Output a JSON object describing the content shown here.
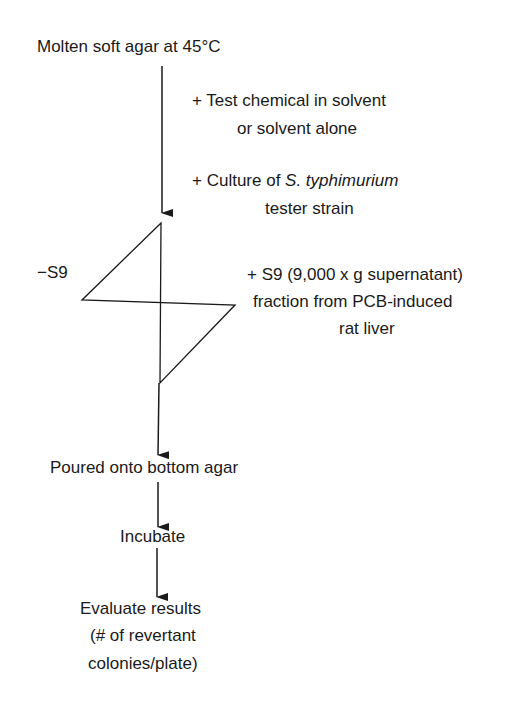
{
  "diagram": {
    "start": "Molten soft agar at 45°C",
    "addition_1": {
      "line1": "+ Test chemical in solvent",
      "line2": "or solvent alone"
    },
    "addition_2": {
      "prefix": "+ Culture of ",
      "organism": "S. typhimurium",
      "line2": "tester strain"
    },
    "branch_left": "−S9",
    "branch_right": {
      "line1": "+ S9 (9,000 x g supernatant)",
      "line2": "fraction from PCB-induced",
      "line3": "rat liver"
    },
    "step_pour": "Poured onto bottom agar",
    "step_incubate": "Incubate",
    "step_evaluate": {
      "line1": "Evaluate  results",
      "line2": "(# of revertant",
      "line3": "colonies/plate)"
    }
  }
}
